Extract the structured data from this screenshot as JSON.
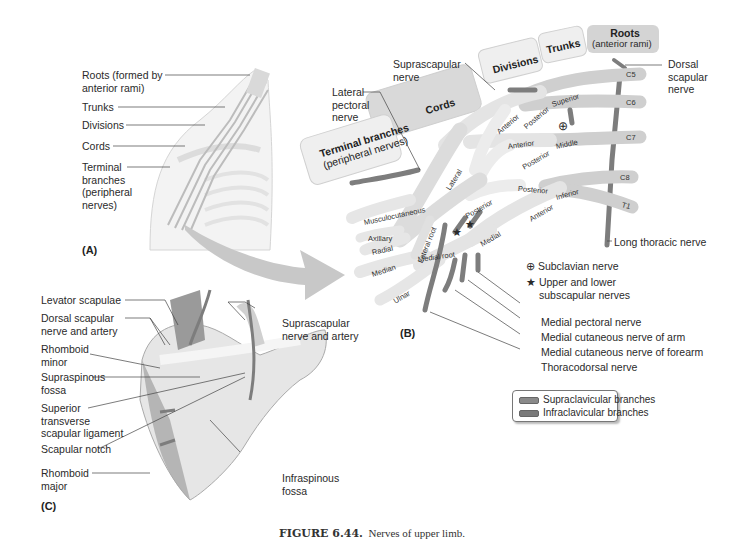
{
  "figure": {
    "caption_label": "FIGURE 6.44.",
    "caption_text": "Nerves of upper limb."
  },
  "panel_a": {
    "letter": "(A)",
    "labels": [
      {
        "text": "Roots (formed by",
        "text2": "anterior rami)"
      },
      {
        "text": "Trunks"
      },
      {
        "text": "Divisions"
      },
      {
        "text": "Cords"
      },
      {
        "text": "Terminal",
        "text2": "branches",
        "text3": "(peripheral",
        "text4": "nerves)"
      }
    ]
  },
  "panel_b": {
    "letter": "(B)",
    "headers": {
      "roots": "Roots",
      "roots_sub": "(anterior rami)",
      "trunks": "Trunks",
      "divisions": "Divisions",
      "cords": "Cords",
      "terminal": "Terminal branches",
      "terminal_sub": "(peripheral nerves)"
    },
    "roots": [
      "C5",
      "C6",
      "C7",
      "C8",
      "T1"
    ],
    "trunks": [
      "Superior",
      "Middle",
      "Inferior"
    ],
    "divisions": [
      "Anterior",
      "Posterior",
      "Anterior",
      "Posterior",
      "Posterior",
      "Anterior"
    ],
    "cords": [
      "Lateral",
      "Posterior",
      "Medial"
    ],
    "roots_of_median": [
      "Lateral root",
      "Medial root"
    ],
    "terminal_branches": [
      "Musculocutaneous",
      "Axillary",
      "Radial",
      "Median",
      "Ulnar"
    ],
    "callouts": {
      "suprascapular": "Suprascapular",
      "suprascapular2": "nerve",
      "lateral_pectoral": "Lateral",
      "lateral_pectoral2": "pectoral",
      "lateral_pectoral3": "nerve",
      "dorsal_scapular": "Dorsal",
      "dorsal_scapular2": "scapular",
      "dorsal_scapular3": "nerve",
      "long_thoracic": "Long thoracic nerve",
      "medial_pectoral": "Medial pectoral nerve",
      "medial_cut_arm": "Medial cutaneous nerve of arm",
      "medial_cut_forearm": "Medial cutaneous nerve of forearm",
      "thoracodorsal": "Thoracodorsal nerve"
    },
    "symbol_key": [
      {
        "symbol": "⊕",
        "text": "Subclavian nerve"
      },
      {
        "symbol": "★",
        "text": "Upper and lower",
        "text2": "subscapular nerves"
      }
    ],
    "legend": [
      {
        "label": "Supraclavicular branches",
        "color": "#8a8a8a"
      },
      {
        "label": "Infraclavicular branches",
        "color": "#7a7a7a"
      }
    ],
    "colors": {
      "nerve_fill": "#e4e4e4",
      "nerve_dark": "#c9c9c9",
      "branch": "#7d7d7d",
      "header_fill": "#efefef",
      "header_dark": "#d6d6d6"
    }
  },
  "panel_c": {
    "letter": "(C)",
    "labels_left": [
      {
        "text": "Levator scapulae"
      },
      {
        "text": "Dorsal scapular",
        "text2": "nerve and artery"
      },
      {
        "text": "Rhomboid",
        "text2": "minor"
      },
      {
        "text": "Supraspinous",
        "text2": "fossa"
      },
      {
        "text": "Superior",
        "text2": "transverse",
        "text3": "scapular ligament"
      },
      {
        "text": "Scapular notch"
      },
      {
        "text": "Rhomboid",
        "text2": "major"
      }
    ],
    "labels_right": [
      {
        "text": "Suprascapular",
        "text2": "nerve and artery"
      },
      {
        "text": "Infraspinous",
        "text2": "fossa"
      }
    ]
  }
}
